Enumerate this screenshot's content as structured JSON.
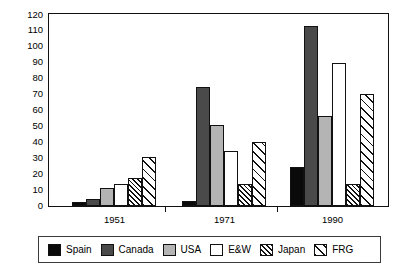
{
  "chart_data": {
    "type": "bar",
    "title": "",
    "subtitle": "",
    "xlabel": "",
    "ylabel": "",
    "categories": [
      "1951",
      "1971",
      "1990"
    ],
    "ylim": [
      0,
      120
    ],
    "yticks": [
      0,
      10,
      20,
      30,
      40,
      50,
      60,
      70,
      80,
      90,
      100,
      110,
      120
    ],
    "grid": false,
    "legend_position": "bottom",
    "series": [
      {
        "name": "Spain",
        "values": [
          2,
          3,
          24
        ],
        "color": "#0a0a0a",
        "pattern": "solid"
      },
      {
        "name": "Canada",
        "values": [
          4,
          74.5,
          113
        ],
        "color": "#4a4a4a",
        "pattern": "solid"
      },
      {
        "name": "USA",
        "values": [
          11,
          50.5,
          56
        ],
        "color": "#b4b4b4",
        "pattern": "solid"
      },
      {
        "name": "E&W",
        "values": [
          13.5,
          34,
          89.5
        ],
        "color": "#ffffff",
        "pattern": "solid"
      },
      {
        "name": "Japan",
        "values": [
          17,
          13.5,
          13.5
        ],
        "color": "#ffffff",
        "pattern": "dense-diagonal-hatch"
      },
      {
        "name": "FRG",
        "values": [
          30.5,
          40,
          70
        ],
        "color": "#ffffff",
        "pattern": "sparse-diagonal-hatch"
      }
    ]
  },
  "legend": {
    "items": [
      {
        "label": "Spain",
        "swatch": "legend-swatch-spain"
      },
      {
        "label": "Canada",
        "swatch": "legend-swatch-canada"
      },
      {
        "label": "USA",
        "swatch": "legend-swatch-usa"
      },
      {
        "label": "E&W",
        "swatch": "legend-swatch-ew"
      },
      {
        "label": "Japan",
        "swatch": "legend-swatch-japan"
      },
      {
        "label": "FRG",
        "swatch": "legend-swatch-frg"
      }
    ]
  },
  "axis": {
    "y_tick_labels": [
      "0",
      "10",
      "20",
      "30",
      "40",
      "50",
      "60",
      "70",
      "80",
      "90",
      "100",
      "110",
      "120"
    ],
    "x_tick_labels": [
      "1951",
      "1971",
      "1990"
    ]
  }
}
